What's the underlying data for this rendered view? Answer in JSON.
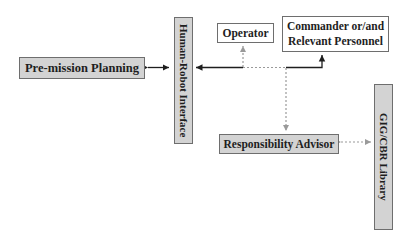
{
  "diagram": {
    "nodes": {
      "pre_mission": "Pre-mission Planning",
      "hri": "Human-Robot Interface",
      "operator": "Operator",
      "commander": "Commander or/and Relevant Personnel",
      "commander_line1": "Commander or/and",
      "commander_line2": "Relevant Personnel",
      "advisor": "Responsibility Advisor",
      "library": "GIG/CBR Library"
    },
    "edges": [
      {
        "from": "Pre-mission Planning",
        "to": "Human-Robot Interface",
        "style": "solid",
        "direction": "both"
      },
      {
        "from": "Commander or/and Relevant Personnel",
        "to": "Human-Robot Interface",
        "style": "solid",
        "direction": "both"
      },
      {
        "from": "Operator",
        "to": "control line",
        "style": "dotted",
        "direction": "to-operator"
      },
      {
        "from": "control line",
        "to": "Responsibility Advisor",
        "style": "dotted",
        "direction": "to-advisor"
      },
      {
        "from": "Responsibility Advisor",
        "to": "GIG/CBR Library",
        "style": "dotted",
        "direction": "both"
      }
    ],
    "colors": {
      "box_fill_grey": "#d3d3d3",
      "box_fill_white": "#ffffff",
      "box_border": "#6e6e6e",
      "solid_line": "#1e1e1e",
      "dotted_line": "#9a9a9a"
    }
  }
}
